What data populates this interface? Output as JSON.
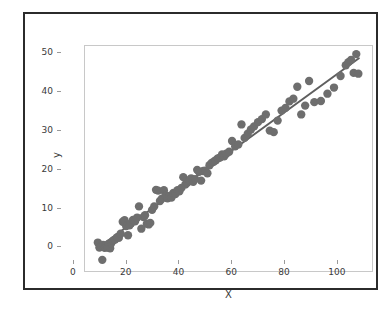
{
  "chart_data": {
    "type": "scatter",
    "title": "",
    "xlabel": "X",
    "ylabel": "y",
    "xlim": [
      -4.5,
      105
    ],
    "ylim": [
      -3.5,
      55
    ],
    "xticks": [
      0,
      20,
      40,
      60,
      80,
      100
    ],
    "yticks": [
      0,
      10,
      20,
      30,
      40,
      50
    ],
    "grid": false,
    "legend": null,
    "marker_color": "#6e6e6e",
    "line_color": "#5f5f5f",
    "marker_size": 4.2,
    "line_width": 2.0,
    "n_points": 100,
    "series": [
      {
        "name": "observations",
        "type": "scatter",
        "x": [
          0.4,
          1.0,
          1.6,
          2.1,
          2.4,
          3.0,
          3.3,
          3.8,
          4.2,
          4.6,
          5.1,
          5.5,
          6.2,
          7.0,
          7.8,
          8.4,
          9.1,
          9.9,
          10.6,
          11.2,
          11.9,
          12.5,
          13.1,
          13.8,
          14.6,
          15.4,
          16.1,
          17.0,
          17.8,
          18.4,
          19.1,
          19.8,
          20.4,
          21.1,
          21.9,
          22.6,
          23.4,
          24.1,
          24.8,
          25.6,
          26.3,
          27.0,
          27.8,
          28.5,
          29.2,
          30.0,
          30.8,
          31.5,
          32.3,
          33.0,
          33.8,
          34.5,
          35.3,
          36.0,
          36.8,
          37.5,
          38.3,
          39.0,
          39.8,
          40.6,
          41.4,
          42.2,
          43.0,
          43.8,
          44.6,
          45.4,
          46.2,
          47.0,
          47.8,
          48.6,
          49.4,
          50.5,
          51.6,
          52.8,
          54.0,
          55.2,
          56.4,
          57.6,
          58.8,
          60.0,
          61.5,
          63.0,
          64.5,
          66.0,
          67.5,
          69.0,
          70.5,
          72.0,
          73.5,
          75.0,
          76.5,
          78.0,
          79.5,
          81.0,
          83.0,
          85.5,
          88.0,
          90.5,
          93.0,
          95.0,
          96.0,
          97.0,
          98.0,
          99.0,
          99.8
        ],
        "y": [
          3.9,
          2.6,
          2.9,
          -0.6,
          3.3,
          2.5,
          3.0,
          2.7,
          2.6,
          3.6,
          2.4,
          3.7,
          4.4,
          4.7,
          5.3,
          5.1,
          6.2,
          9.3,
          9.7,
          8.2,
          5.8,
          8.4,
          8.9,
          9.8,
          9.4,
          10.4,
          13.3,
          7.5,
          10.5,
          11.0,
          8.8,
          8.6,
          9.0,
          12.4,
          13.3,
          17.6,
          17.4,
          14.7,
          15.3,
          17.5,
          16.2,
          15.4,
          16.0,
          15.6,
          16.8,
          16.5,
          17.5,
          17.2,
          18.1,
          20.9,
          19.0,
          19.4,
          20.1,
          20.6,
          19.7,
          20.4,
          22.8,
          22.3,
          20.0,
          22.5,
          22.6,
          21.9,
          24.0,
          24.6,
          24.9,
          25.3,
          25.8,
          26.0,
          26.8,
          26.3,
          27.0,
          27.5,
          30.3,
          28.9,
          29.4,
          34.6,
          31.1,
          32.2,
          33.3,
          34.1,
          35.2,
          36.0,
          37.2,
          33.0,
          32.6,
          35.6,
          38.2,
          38.9,
          40.6,
          41.3,
          44.4,
          37.2,
          39.5,
          45.9,
          40.4,
          40.7,
          42.6,
          44.2,
          47.2,
          50.0,
          50.8,
          51.4,
          48.0,
          52.9,
          47.8
        ]
      },
      {
        "name": "fit-line",
        "type": "line",
        "x": [
          0,
          100
        ],
        "y": [
          2.3,
          51.8
        ]
      }
    ]
  }
}
